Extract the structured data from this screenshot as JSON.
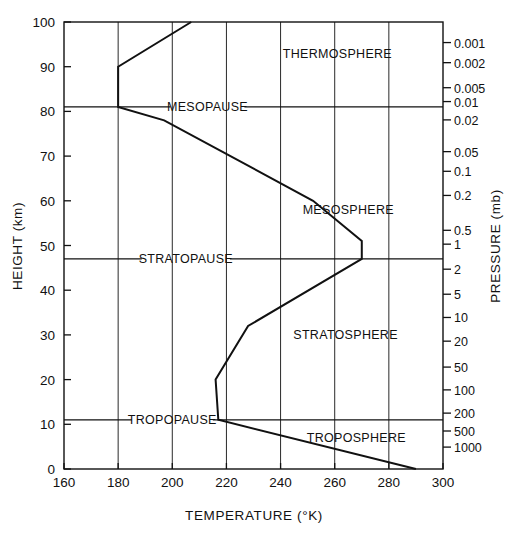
{
  "chart_data": {
    "type": "line",
    "title": "",
    "xlabel": "TEMPERATURE  (°K)",
    "ylabel": "HEIGHT  (km)",
    "y2label": "PRESSURE  (mb)",
    "xlim": [
      160,
      300
    ],
    "ylim": [
      0,
      100
    ],
    "grid": true,
    "legend": "none",
    "xticks": [
      160,
      180,
      200,
      220,
      240,
      260,
      280,
      300
    ],
    "xtick_labels": [
      "160",
      "180",
      "200",
      "220",
      "240",
      "260",
      "280",
      "300"
    ],
    "yticks": [
      0,
      10,
      20,
      30,
      40,
      50,
      60,
      70,
      80,
      90,
      100
    ],
    "ytick_labels": [
      "0",
      "10",
      "20",
      "30",
      "40",
      "50",
      "60",
      "70",
      "80",
      "90",
      "100"
    ],
    "pressure_ticks": [
      {
        "label": "0.001",
        "height_km": 95.4
      },
      {
        "label": "0.002",
        "height_km": 90.9
      },
      {
        "label": "0.005",
        "height_km": 85.3
      },
      {
        "label": "0.01",
        "height_km": 82.2
      },
      {
        "label": "0.02",
        "height_km": 78.1
      },
      {
        "label": "0.05",
        "height_km": 71.0
      },
      {
        "label": "0.1",
        "height_km": 66.6
      },
      {
        "label": "0.2",
        "height_km": 61.2
      },
      {
        "label": "0.5",
        "height_km": 53.4
      },
      {
        "label": "1",
        "height_km": 50.3
      },
      {
        "label": "2",
        "height_km": 44.7
      },
      {
        "label": "5",
        "height_km": 39.1
      },
      {
        "label": "10",
        "height_km": 33.9
      },
      {
        "label": "20",
        "height_km": 28.6
      },
      {
        "label": "50",
        "height_km": 22.8
      },
      {
        "label": "100",
        "height_km": 17.7
      },
      {
        "label": "200",
        "height_km": 12.5
      },
      {
        "label": "500",
        "height_km": 8.5
      },
      {
        "label": "1000",
        "height_km": 4.9
      }
    ],
    "series": [
      {
        "name": "U.S. Standard Atmosphere temperature profile",
        "points": [
          {
            "t": 290,
            "h": 0
          },
          {
            "t": 217,
            "h": 11
          },
          {
            "t": 216,
            "h": 20
          },
          {
            "t": 228,
            "h": 32
          },
          {
            "t": 270,
            "h": 47
          },
          {
            "t": 270,
            "h": 51
          },
          {
            "t": 252,
            "h": 60
          },
          {
            "t": 197,
            "h": 78
          },
          {
            "t": 180,
            "h": 81
          },
          {
            "t": 180,
            "h": 90
          },
          {
            "t": 207,
            "h": 100
          }
        ]
      }
    ],
    "boundaries": [
      {
        "name": "TROPOPAUSE",
        "height_km": 11,
        "label_temp": 200
      },
      {
        "name": "STRATOPAUSE",
        "height_km": 47,
        "label_temp": 205
      },
      {
        "name": "MESOPAUSE",
        "height_km": 81,
        "label_temp": 213
      }
    ],
    "layers": [
      {
        "name": "TROPOSPHERE",
        "label_temp": 268,
        "label_height_km": 7
      },
      {
        "name": "STRATOSPHERE",
        "label_temp": 264,
        "label_height_km": 30
      },
      {
        "name": "MESOSPHERE",
        "label_temp": 265,
        "label_height_km": 58
      },
      {
        "name": "THERMOSPHERE",
        "label_temp": 261,
        "label_height_km": 93
      }
    ]
  }
}
